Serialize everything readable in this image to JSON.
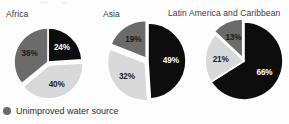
{
  "figure": {
    "background": "#fdfdfd",
    "width": 289,
    "height": 124
  },
  "legend": {
    "icon": "circle-bullet-icon",
    "label": "Unimproved water source",
    "swatch_color": "#6b6b6b"
  },
  "palette": {
    "black": "#0d0d0d",
    "light_gray": "#d9d9d9",
    "dark_gray": "#6b6b6b",
    "outline": "#ffffff",
    "label_on_dark": "#ffffff",
    "label_on_light": "#1a1a1a",
    "title_color": "#3a3a3a"
  },
  "chart_data": [
    {
      "type": "pie",
      "title": "Africa",
      "categories": [
        "Black segment",
        "Light gray segment",
        "Dark gray segment"
      ],
      "values": [
        24,
        40,
        36
      ],
      "labels": [
        "24%",
        "40%",
        "36%"
      ],
      "colors": [
        "#0d0d0d",
        "#d9d9d9",
        "#6b6b6b"
      ],
      "exploded": [
        false,
        true,
        false
      ],
      "start_angle_deg": 0,
      "units": "percent",
      "legend_position": "bottom"
    },
    {
      "type": "pie",
      "title": "Asia",
      "categories": [
        "Black segment",
        "Light gray segment",
        "Dark gray segment"
      ],
      "values": [
        49,
        32,
        19
      ],
      "labels": [
        "49%",
        "32%",
        "19%"
      ],
      "colors": [
        "#0d0d0d",
        "#d9d9d9",
        "#6b6b6b"
      ],
      "exploded": [
        false,
        true,
        true
      ],
      "start_angle_deg": 0,
      "units": "percent",
      "legend_position": "bottom"
    },
    {
      "type": "pie",
      "title": "Latin America and Caribbean",
      "categories": [
        "Black segment",
        "Light gray segment",
        "Dark gray segment"
      ],
      "values": [
        66,
        21,
        13
      ],
      "labels": [
        "66%",
        "21%",
        "13%"
      ],
      "colors": [
        "#0d0d0d",
        "#d9d9d9",
        "#6b6b6b"
      ],
      "exploded": [
        false,
        false,
        true
      ],
      "start_angle_deg": 0,
      "units": "percent",
      "legend_position": "bottom"
    }
  ],
  "pies": [
    {
      "id": "africa",
      "left": 6,
      "top": 24,
      "size": 84,
      "radius": 34,
      "cx": 42,
      "cy": 38,
      "title_left": 6,
      "title_top": 9
    },
    {
      "id": "asia",
      "left": 103,
      "top": 19,
      "size": 86,
      "radius": 38,
      "cx": 45,
      "cy": 42,
      "title_left": 103,
      "title_top": 9
    },
    {
      "id": "latin-america",
      "left": 200,
      "top": 17,
      "size": 88,
      "radius": 39,
      "cx": 44,
      "cy": 44,
      "title_left": 168,
      "title_top": 8
    }
  ]
}
